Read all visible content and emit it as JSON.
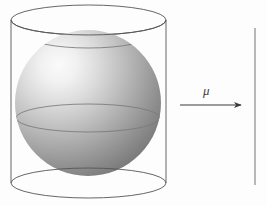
{
  "figure": {
    "name": "sphere-inscribed-in-cylinder",
    "canvas": {
      "width": 267,
      "height": 206
    },
    "background_color": "#fdfdfd"
  },
  "labels": {
    "mu": "μ"
  },
  "chart_data": {
    "type": "diagram",
    "title": "",
    "subtitle": "",
    "xlabel": "",
    "ylabel": "",
    "grid": false,
    "legend": null,
    "annotations": [
      {
        "name": "mu-label",
        "text": "μ",
        "style": "italic",
        "x": 207,
        "y": 92,
        "color": "#3a3a3a"
      }
    ],
    "shapes": [
      {
        "name": "cylinder",
        "kind": "cylinder-wireframe",
        "stroke": "#555555",
        "stroke_width": 0.9,
        "fill": "none",
        "center_x": 88.5,
        "radius_x": 77.5,
        "radius_y": 15,
        "top_center_y": 20,
        "bottom_center_y": 183,
        "left_x": 11,
        "right_x": 166
      },
      {
        "name": "sphere",
        "kind": "shaded-sphere",
        "center_x": 88,
        "center_y": 103,
        "radius": 73,
        "highlight_color": "#f2f2f2",
        "midtone_color": "#b5b5b5",
        "shadow_color": "#6f6f6f",
        "light_direction": "upper-left",
        "latitude_lines": [
          {
            "name": "top-circle",
            "center_y": 35,
            "radius_x": 62,
            "radius_y": 13
          },
          {
            "name": "equator",
            "center_y": 118,
            "radius_x": 72,
            "radius_y": 14
          }
        ],
        "stroke": "#7a7a7a"
      },
      {
        "name": "mu-arrow",
        "kind": "arrow",
        "x1": 180,
        "y1": 105,
        "x2": 242,
        "y2": 105,
        "stroke": "#3a3a3a",
        "stroke_width": 1.1,
        "head": "solid-triangle"
      },
      {
        "name": "vertical-rule",
        "kind": "line",
        "x1": 255,
        "y1": 28,
        "x2": 255,
        "y2": 185,
        "stroke": "#8a8a8a",
        "stroke_width": 1.2
      }
    ],
    "colors": {
      "background": "#fdfdfd",
      "outline": "#555555",
      "sphere_light": "#f2f2f2",
      "sphere_dark": "#6f6f6f",
      "arrow": "#3a3a3a",
      "rule": "#8a8a8a"
    }
  }
}
